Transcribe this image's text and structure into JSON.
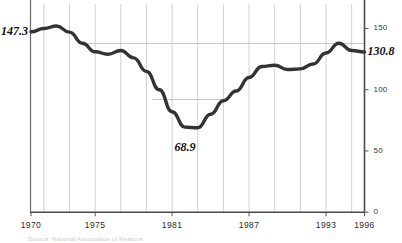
{
  "chart_data": {
    "type": "line",
    "title": "",
    "subtitle": "",
    "xlabel": "",
    "ylabel": "",
    "xlim": [
      1970,
      1996
    ],
    "ylim": [
      0,
      170
    ],
    "yticks": [
      0,
      50,
      100,
      150
    ],
    "ytick_labels": [
      "0",
      "50",
      "100",
      "150"
    ],
    "xticks": [
      1970,
      1975,
      1981,
      1987,
      1993,
      1996
    ],
    "xtick_labels": [
      "1970",
      "1975",
      "1981",
      "1987",
      "1993",
      "1996"
    ],
    "grid": "partial-horizontal-and-vertical",
    "legend": "none",
    "series": [
      {
        "name": "value",
        "x": [
          1970,
          1971,
          1972,
          1973,
          1974,
          1975,
          1976,
          1977,
          1978,
          1979,
          1980,
          1981,
          1982,
          1983,
          1984,
          1985,
          1986,
          1987,
          1988,
          1989,
          1990,
          1991,
          1992,
          1993,
          1994,
          1995,
          1996
        ],
        "values": [
          147.3,
          150.0,
          152.0,
          147.0,
          138.0,
          131.0,
          129.0,
          132.0,
          126.0,
          115.0,
          100.0,
          82.0,
          69.5,
          68.9,
          80.0,
          91.0,
          99.0,
          110.0,
          119.0,
          120.0,
          116.5,
          117.0,
          121.0,
          130.0,
          138.0,
          132.0,
          130.8
        ]
      }
    ],
    "annotations": [
      {
        "name": "start-value",
        "label": "147.3",
        "x": 1970,
        "y": 147.3,
        "position": "left"
      },
      {
        "name": "min-value",
        "label": "68.9",
        "x": 1982,
        "y": 68.9,
        "position": "below"
      },
      {
        "name": "end-value",
        "label": "130.8",
        "x": 1996,
        "y": 130.8,
        "position": "right"
      }
    ],
    "colors": {
      "line": "#333333",
      "axis": "#555555",
      "grid": "#bbbbbb",
      "background": "#ffffff",
      "tick_text": "#2b2b2b",
      "callout_text": "#111111"
    }
  },
  "axis": {
    "y_labels": [
      "150",
      "100",
      "50",
      "0"
    ],
    "x_labels": [
      "1970",
      "1975",
      "1981",
      "1987",
      "1993",
      "1996"
    ]
  },
  "callouts": {
    "start": "147.3",
    "min": "68.9",
    "end": "130.8"
  },
  "footer": {
    "source_note": "Source: National Association of Realtors"
  }
}
